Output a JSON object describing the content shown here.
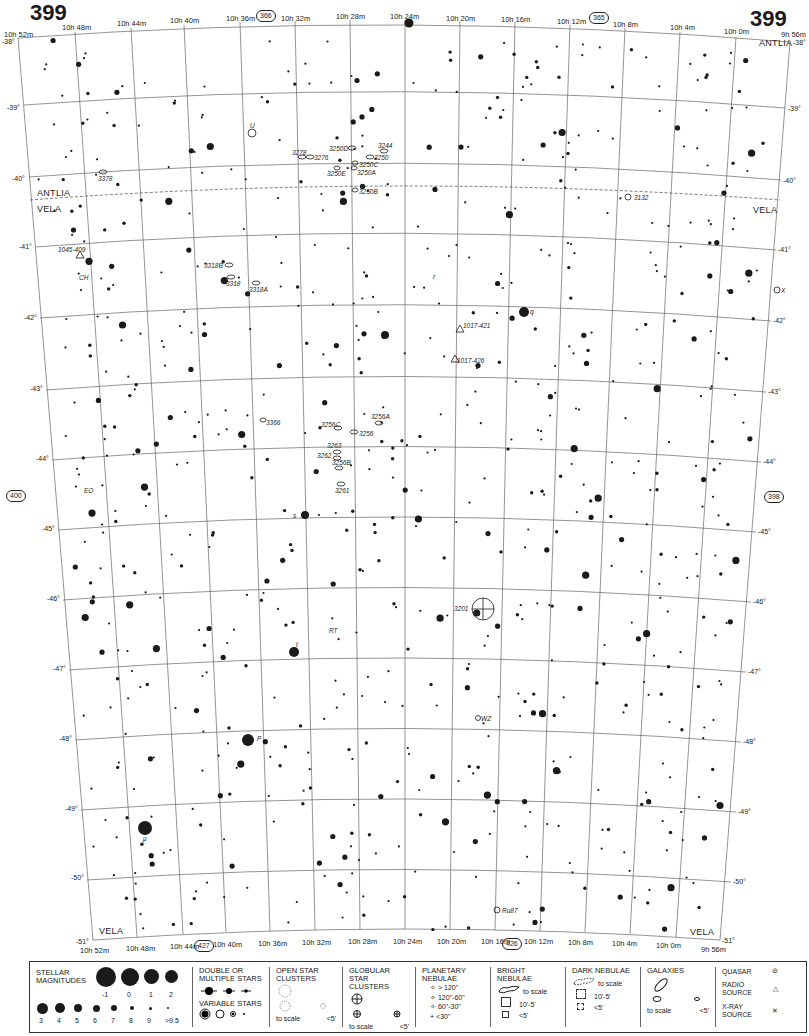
{
  "page": {
    "number_left": "399",
    "number_right": "399",
    "adjacent_top": "366",
    "adjacent_top_right": "365",
    "adjacent_left": "400",
    "adjacent_right": "398",
    "adjacent_bottom_left": "427",
    "adjacent_bottom_right": "426"
  },
  "ra_top": [
    "10h 52m",
    "10h 48m",
    "10h 44m",
    "10h 40m",
    "10h 36m",
    "10h 32m",
    "10h 28m",
    "10h 24m",
    "10h 20m",
    "10h 16m",
    "10h 12m",
    "10h 8m",
    "10h 4m",
    "10h 0m",
    "9h 56m"
  ],
  "ra_bottom": [
    "10h 52m",
    "10h 48m",
    "10h 44m",
    "10h 40m",
    "10h 36m",
    "10h 32m",
    "10h 28m",
    "10h 24m",
    "10h 20m",
    "10h 16m",
    "10h 12m",
    "10h 8m",
    "10h 4m",
    "10h 0m",
    "9h 56m"
  ],
  "dec_left": [
    "-38°",
    "-39°",
    "-40°",
    "-41°",
    "-42°",
    "-43°",
    "-44°",
    "-45°",
    "-46°",
    "-47°",
    "-48°",
    "-49°",
    "-50°",
    "-51°"
  ],
  "dec_right": [
    "-38°",
    "-39°",
    "-40°",
    "-41°",
    "-42°",
    "-43°",
    "-44°",
    "-45°",
    "-46°",
    "-47°",
    "-48°",
    "-49°",
    "-50°",
    "-51°"
  ],
  "constellations": {
    "antlia_top_left": "ANTLIA",
    "vela_top_left": "VELA",
    "antlia_top_right": "ANTLIA",
    "vela_top_right": "VELA",
    "vela_bottom_left": "VELA",
    "vela_bottom_right": "VELA"
  },
  "objects": {
    "o3378": "3378",
    "o3278": "3278",
    "o3276": "3276",
    "o3250d": "3250D",
    "o3244": "3244",
    "o3250": "3250",
    "o3250c": "3250C",
    "o3250e": "3250E",
    "o3250a": "3250A",
    "o3250b": "3250B",
    "o3132": "3132",
    "o1045": "1045-409",
    "ch": "CH",
    "o3318b": "3318B",
    "o3318": "3318",
    "o3318a": "3318A",
    "u": "U",
    "r": "r",
    "q": "q",
    "x": "X",
    "o1017_421": "1017-421",
    "o1017_426": "1017-426",
    "o3366": "3366",
    "o3256c": "3256C",
    "o3256": "3256",
    "o3256a": "3256A",
    "o3263": "3263",
    "o3262": "3262",
    "o3256b": "3256B",
    "o3261": "3261",
    "eo": "EO",
    "s": "s",
    "o3201": "3201",
    "rt": "RT",
    "t": "t",
    "wz": "WZ",
    "p": "P",
    "mu": "μ",
    "ru87": "Ru87"
  },
  "legend": {
    "stellar": {
      "title": "STELLAR MAGNITUDES",
      "big_labels": [
        "-1",
        "0",
        "1",
        "2"
      ],
      "small_labels": [
        "3",
        "4",
        "5",
        "6",
        "7",
        "8",
        "9",
        ">9.5"
      ]
    },
    "double": {
      "title": "DOUBLE OR MULTIPLE STARS"
    },
    "variable": {
      "title": "VARIABLE STARS"
    },
    "open": {
      "title": "OPEN STAR CLUSTERS",
      "to_scale": "to scale",
      "small": "<5'"
    },
    "globular": {
      "title": "GLOBULAR STAR CLUSTERS",
      "to_scale": "to scale",
      "small": "<5'"
    },
    "planetary": {
      "title": "PLANETARY NEBULAE",
      "sizes": [
        "> 120\"",
        "120\"-60\"",
        "60\"-30\"",
        "<30\""
      ]
    },
    "bright": {
      "title": "BRIGHT NEBULAE",
      "to_scale": "to scale",
      "mid": "10'-5'",
      "small": "<5'"
    },
    "dark": {
      "title": "DARK NEBULAE",
      "to_scale": "to scale",
      "mid": "10'-5'",
      "small": "<5'"
    },
    "galaxies": {
      "title": "GALAXIES",
      "to_scale": "to scale",
      "small": "<5'"
    },
    "quasar": "QUASAR",
    "radio": "RADIO SOURCE",
    "xray": "X-RAY SOURCE"
  },
  "colors": {
    "ink": "#1a1a1a",
    "grid": "#555555",
    "paper": "#ffffff"
  }
}
